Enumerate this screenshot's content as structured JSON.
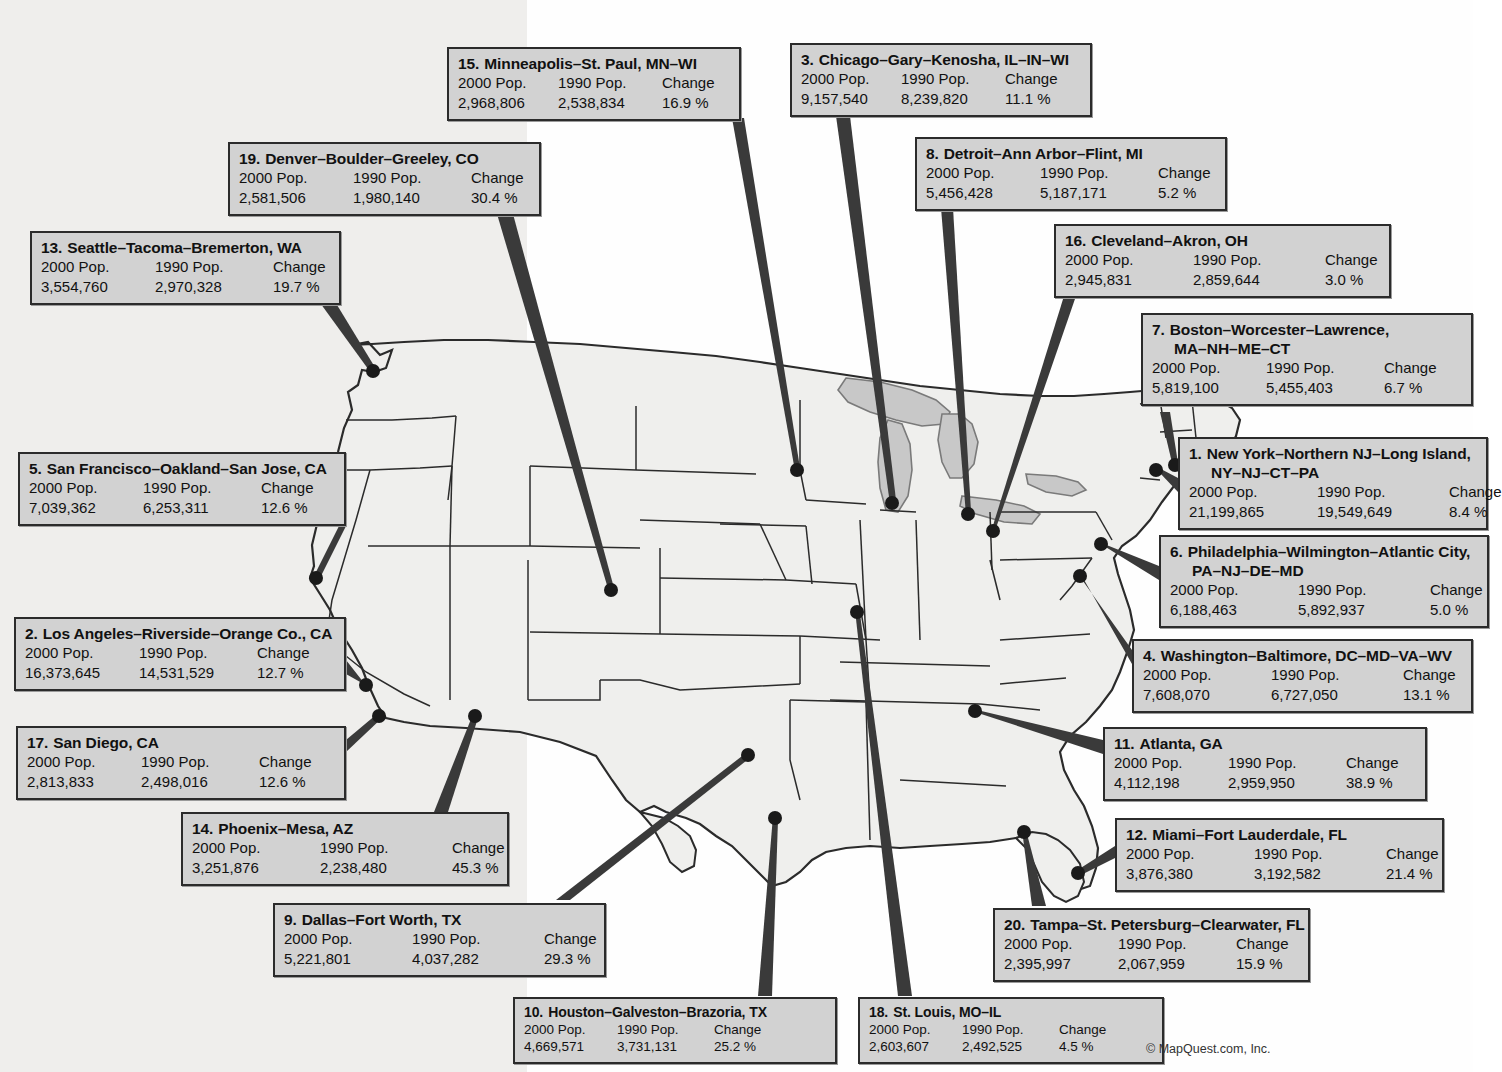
{
  "credit": "© MapQuest.com, Inc.",
  "title_ghost": "",
  "columns": {
    "pop2000": "2000 Pop.",
    "pop1990": "1990 Pop.",
    "change": "Change"
  },
  "map": {
    "land_color": "#efefed",
    "lake_color": "#c8c8c8",
    "border_color": "#2b2b2b",
    "dot_color": "#1a1a1a",
    "leader_color": "#3a3a3a"
  },
  "callouts": [
    {
      "id": "minneapolis",
      "rank": "15.",
      "name": "Minneapolis–St. Paul, MN–WI",
      "name2": "",
      "pop2000": "2,968,806",
      "pop1990": "2,538,834",
      "change": "16.9 %",
      "x": 447,
      "y": 47,
      "w": 294,
      "cols": "narrowcols",
      "compact": false
    },
    {
      "id": "chicago",
      "rank": "3.",
      "name": "Chicago–Gary–Kenosha, IL–IN–WI",
      "name2": "",
      "pop2000": "9,157,540",
      "pop1990": "8,239,820",
      "change": "11.1 %",
      "x": 790,
      "y": 43,
      "w": 302,
      "cols": "narrowcols",
      "compact": false
    },
    {
      "id": "denver",
      "rank": "19.",
      "name": "Denver–Boulder–Greeley, CO",
      "name2": "",
      "pop2000": "2,581,506",
      "pop1990": "1,980,140",
      "change": "30.4 %",
      "x": 228,
      "y": 142,
      "w": 313,
      "cols": "",
      "compact": false
    },
    {
      "id": "detroit",
      "rank": "8.",
      "name": "Detroit–Ann Arbor–Flint, MI",
      "name2": "",
      "pop2000": "5,456,428",
      "pop1990": "5,187,171",
      "change": "5.2 %",
      "x": 915,
      "y": 137,
      "w": 312,
      "cols": "",
      "compact": false
    },
    {
      "id": "seattle",
      "rank": "13.",
      "name": "Seattle–Tacoma–Bremerton, WA",
      "name2": "",
      "pop2000": "3,554,760",
      "pop1990": "2,970,328",
      "change": "19.7 %",
      "x": 30,
      "y": 231,
      "w": 311,
      "cols": "",
      "compact": false
    },
    {
      "id": "cleveland",
      "rank": "16.",
      "name": "Cleveland–Akron, OH",
      "name2": "",
      "pop2000": "2,945,831",
      "pop1990": "2,859,644",
      "change": "3.0 %",
      "x": 1054,
      "y": 224,
      "w": 337,
      "cols": "widecols",
      "compact": false
    },
    {
      "id": "boston",
      "rank": "7.",
      "name": "Boston–Worcester–Lawrence,",
      "name2": "MA–NH–ME–CT",
      "pop2000": "5,819,100",
      "pop1990": "5,455,403",
      "change": "6.7 %",
      "x": 1141,
      "y": 313,
      "w": 332,
      "cols": "",
      "compact": false
    },
    {
      "id": "sanfrancisco",
      "rank": "5.",
      "name": "San Francisco–Oakland–San Jose, CA",
      "name2": "",
      "pop2000": "7,039,362",
      "pop1990": "6,253,311",
      "change": "12.6 %",
      "x": 18,
      "y": 452,
      "w": 328,
      "cols": "",
      "compact": false
    },
    {
      "id": "newyork",
      "rank": "1.",
      "name": "New York–Northern NJ–Long Island,",
      "name2": "NY–NJ–CT–PA",
      "pop2000": "21,199,865",
      "pop1990": "19,549,649",
      "change": "8.4 %",
      "x": 1178,
      "y": 437,
      "w": 310,
      "cols": "widecols",
      "compact": false
    },
    {
      "id": "philadelphia",
      "rank": "6.",
      "name": "Philadelphia–Wilmington–Atlantic City,",
      "name2": "PA–NJ–DE–MD",
      "pop2000": "6,188,463",
      "pop1990": "5,892,937",
      "change": "5.0 %",
      "x": 1159,
      "y": 535,
      "w": 330,
      "cols": "widecols",
      "compact": false
    },
    {
      "id": "losangeles",
      "rank": "2.",
      "name": "Los Angeles–Riverside–Orange Co., CA",
      "name2": "",
      "pop2000": "16,373,645",
      "pop1990": "14,531,529",
      "change": "12.7 %",
      "x": 14,
      "y": 617,
      "w": 332,
      "cols": "",
      "compact": false
    },
    {
      "id": "washington",
      "rank": "4.",
      "name": "Washington–Baltimore, DC–MD–VA–WV",
      "name2": "",
      "pop2000": "7,608,070",
      "pop1990": "6,727,050",
      "change": "13.1 %",
      "x": 1132,
      "y": 639,
      "w": 341,
      "cols": "widecols",
      "compact": false
    },
    {
      "id": "sandiego",
      "rank": "17.",
      "name": "San Diego, CA",
      "name2": "",
      "pop2000": "2,813,833",
      "pop1990": "2,498,016",
      "change": "12.6 %",
      "x": 16,
      "y": 726,
      "w": 330,
      "cols": "",
      "compact": false
    },
    {
      "id": "atlanta",
      "rank": "11.",
      "name": "Atlanta, GA",
      "name2": "",
      "pop2000": "4,112,198",
      "pop1990": "2,959,950",
      "change": "38.9 %",
      "x": 1103,
      "y": 727,
      "w": 324,
      "cols": "",
      "compact": false
    },
    {
      "id": "phoenix",
      "rank": "14.",
      "name": "Phoenix–Mesa, AZ",
      "name2": "",
      "pop2000": "3,251,876",
      "pop1990": "2,238,480",
      "change": "45.3 %",
      "x": 181,
      "y": 812,
      "w": 328,
      "cols": "widecols",
      "compact": false
    },
    {
      "id": "miami",
      "rank": "12.",
      "name": "Miami–Fort Lauderdale, FL",
      "name2": "",
      "pop2000": "3,876,380",
      "pop1990": "3,192,582",
      "change": "21.4 %",
      "x": 1115,
      "y": 818,
      "w": 329,
      "cols": "widecols",
      "compact": false
    },
    {
      "id": "dallas",
      "rank": "9.",
      "name": "Dallas–Fort Worth, TX",
      "name2": "",
      "pop2000": "5,221,801",
      "pop1990": "4,037,282",
      "change": "29.3 %",
      "x": 273,
      "y": 903,
      "w": 333,
      "cols": "widecols",
      "compact": false
    },
    {
      "id": "tampa",
      "rank": "20.",
      "name": "Tampa–St. Petersburg–Clearwater, FL",
      "name2": "",
      "pop2000": "2,395,997",
      "pop1990": "2,067,959",
      "change": "15.9 %",
      "x": 993,
      "y": 908,
      "w": 317,
      "cols": "",
      "compact": false
    },
    {
      "id": "houston",
      "rank": "10.",
      "name": "Houston–Galveston–Brazoria, TX",
      "name2": "",
      "pop2000": "4,669,571",
      "pop1990": "3,731,131",
      "change": "25.2 %",
      "x": 513,
      "y": 997,
      "w": 324,
      "cols": "",
      "compact": true
    },
    {
      "id": "stlouis",
      "rank": "18.",
      "name": "St. Louis, MO–IL",
      "name2": "",
      "pop2000": "2,603,607",
      "pop1990": "2,492,525",
      "change": "4.5 %",
      "x": 858,
      "y": 997,
      "w": 306,
      "cols": "",
      "compact": true
    }
  ],
  "city_dots": [
    {
      "id": "seattle",
      "cx": 373,
      "cy": 371
    },
    {
      "id": "minneapolis",
      "cx": 797,
      "cy": 470
    },
    {
      "id": "denver",
      "cx": 611,
      "cy": 590
    },
    {
      "id": "detroit",
      "cx": 968,
      "cy": 514
    },
    {
      "id": "chicago",
      "cx": 892,
      "cy": 503
    },
    {
      "id": "cleveland",
      "cx": 993,
      "cy": 531
    },
    {
      "id": "boston",
      "cx": 1175,
      "cy": 465
    },
    {
      "id": "newyork",
      "cx": 1156,
      "cy": 470
    },
    {
      "id": "philadelphia",
      "cx": 1101,
      "cy": 544
    },
    {
      "id": "washington",
      "cx": 1080,
      "cy": 576
    },
    {
      "id": "stlouis",
      "cx": 857,
      "cy": 612
    },
    {
      "id": "sanfrancisco",
      "cx": 316,
      "cy": 578
    },
    {
      "id": "losangeles",
      "cx": 366,
      "cy": 685
    },
    {
      "id": "sandiego",
      "cx": 379,
      "cy": 716
    },
    {
      "id": "phoenix",
      "cx": 475,
      "cy": 716
    },
    {
      "id": "dallas",
      "cx": 748,
      "cy": 755
    },
    {
      "id": "atlanta",
      "cx": 975,
      "cy": 711
    },
    {
      "id": "houston",
      "cx": 775,
      "cy": 818
    },
    {
      "id": "tampa",
      "cx": 1024,
      "cy": 832
    },
    {
      "id": "miami",
      "cx": 1078,
      "cy": 873
    }
  ]
}
